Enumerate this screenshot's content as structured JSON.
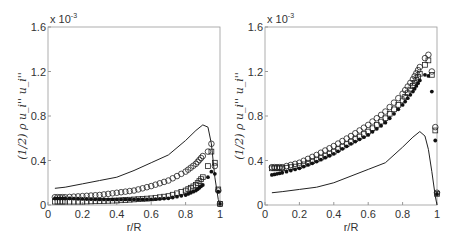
{
  "chart_data": [
    {
      "type": "scatter",
      "title": "",
      "xlabel": "r/R",
      "ylabel": "(1/2) ρ u_i'' u_i''",
      "y_multiplier": "x 10^-3",
      "xlim": [
        0,
        1
      ],
      "ylim": [
        0,
        1.6
      ],
      "xticks": [
        "0",
        "0.2",
        "0.4",
        "0.6",
        "0.8",
        "1"
      ],
      "yticks": [
        "0",
        "0.4",
        "0.8",
        "1.2",
        "1.6"
      ],
      "grid": false,
      "series": [
        {
          "name": "line",
          "marker": "none",
          "x": [
            0.04,
            0.1,
            0.2,
            0.3,
            0.4,
            0.5,
            0.6,
            0.7,
            0.8,
            0.86,
            0.9,
            0.93,
            0.95,
            0.97,
            0.99,
            1.0
          ],
          "y": [
            0.15,
            0.16,
            0.19,
            0.22,
            0.25,
            0.31,
            0.38,
            0.45,
            0.58,
            0.67,
            0.72,
            0.7,
            0.55,
            0.25,
            0.05,
            0.0
          ]
        },
        {
          "name": "circles",
          "marker": "circle",
          "x": [
            0.04,
            0.1,
            0.2,
            0.3,
            0.4,
            0.5,
            0.6,
            0.7,
            0.8,
            0.86,
            0.9,
            0.93,
            0.95,
            0.97,
            0.99,
            1.0
          ],
          "y": [
            0.07,
            0.07,
            0.08,
            0.09,
            0.11,
            0.13,
            0.17,
            0.22,
            0.3,
            0.37,
            0.44,
            0.48,
            0.55,
            0.35,
            0.13,
            0.01
          ]
        },
        {
          "name": "squares",
          "marker": "square",
          "x": [
            0.04,
            0.1,
            0.2,
            0.3,
            0.4,
            0.5,
            0.6,
            0.7,
            0.8,
            0.86,
            0.9,
            0.93,
            0.95,
            0.97,
            0.99,
            1.0
          ],
          "y": [
            0.03,
            0.03,
            0.03,
            0.035,
            0.04,
            0.05,
            0.06,
            0.08,
            0.13,
            0.18,
            0.25,
            0.35,
            0.48,
            0.38,
            0.14,
            0.01
          ]
        },
        {
          "name": "stars",
          "marker": "star",
          "x": [
            0.04,
            0.1,
            0.2,
            0.3,
            0.4,
            0.5,
            0.6,
            0.7,
            0.8,
            0.86,
            0.9,
            0.93,
            0.95,
            0.97,
            0.99,
            1.0
          ],
          "y": [
            0.06,
            0.06,
            0.055,
            0.05,
            0.05,
            0.05,
            0.05,
            0.06,
            0.09,
            0.13,
            0.18,
            0.25,
            0.3,
            0.28,
            0.12,
            0.01
          ]
        }
      ]
    },
    {
      "type": "scatter",
      "title": "",
      "xlabel": "r/R",
      "ylabel": "(1/2) ρ u_i'' u_i''",
      "y_multiplier": "x 10^-3",
      "xlim": [
        0,
        1
      ],
      "ylim": [
        0,
        1.6
      ],
      "xticks": [
        "0",
        "0.2",
        "0.4",
        "0.6",
        "0.8",
        "1"
      ],
      "yticks": [
        "0",
        "0.4",
        "0.8",
        "1.2",
        "1.6"
      ],
      "grid": false,
      "series": [
        {
          "name": "line",
          "marker": "none",
          "x": [
            0.04,
            0.1,
            0.2,
            0.3,
            0.4,
            0.5,
            0.6,
            0.7,
            0.8,
            0.86,
            0.9,
            0.93,
            0.95,
            0.97,
            0.99,
            1.0
          ],
          "y": [
            0.11,
            0.12,
            0.14,
            0.16,
            0.2,
            0.26,
            0.32,
            0.38,
            0.52,
            0.61,
            0.66,
            0.62,
            0.5,
            0.3,
            0.08,
            0.0
          ]
        },
        {
          "name": "circles",
          "marker": "circle",
          "x": [
            0.04,
            0.1,
            0.2,
            0.3,
            0.4,
            0.5,
            0.6,
            0.7,
            0.8,
            0.86,
            0.9,
            0.93,
            0.95,
            0.97,
            0.99,
            1.0
          ],
          "y": [
            0.34,
            0.34,
            0.38,
            0.45,
            0.53,
            0.62,
            0.72,
            0.84,
            1.0,
            1.13,
            1.24,
            1.32,
            1.35,
            1.2,
            0.7,
            0.11
          ]
        },
        {
          "name": "squares",
          "marker": "square",
          "x": [
            0.04,
            0.1,
            0.2,
            0.3,
            0.4,
            0.5,
            0.6,
            0.7,
            0.8,
            0.86,
            0.9,
            0.93,
            0.95,
            0.97,
            0.99,
            1.0
          ],
          "y": [
            0.33,
            0.33,
            0.35,
            0.41,
            0.48,
            0.57,
            0.66,
            0.78,
            0.94,
            1.07,
            1.18,
            1.26,
            1.3,
            1.17,
            0.67,
            0.1
          ]
        },
        {
          "name": "stars",
          "marker": "star",
          "x": [
            0.04,
            0.1,
            0.2,
            0.3,
            0.4,
            0.5,
            0.6,
            0.7,
            0.8,
            0.86,
            0.9,
            0.93,
            0.95,
            0.97,
            0.99,
            1.0
          ],
          "y": [
            0.27,
            0.29,
            0.33,
            0.39,
            0.46,
            0.55,
            0.63,
            0.74,
            0.9,
            1.02,
            1.12,
            1.17,
            1.16,
            1.02,
            0.58,
            0.1
          ]
        }
      ]
    }
  ]
}
